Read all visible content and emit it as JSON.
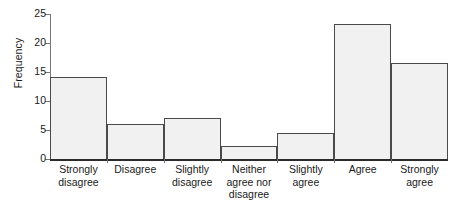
{
  "chart_data": {
    "type": "bar",
    "title": "",
    "xlabel": "",
    "ylabel": "Frequency",
    "categories": [
      "Strongly disagree",
      "Disagree",
      "Slightly disagree",
      "Neither agree nor disagree",
      "Slightly agree",
      "Agree",
      "Strongly agree"
    ],
    "category_lines": [
      [
        "Strongly",
        "disagree"
      ],
      [
        "Disagree"
      ],
      [
        "Slightly",
        "disagree"
      ],
      [
        "Neither",
        "agree nor",
        "disagree"
      ],
      [
        "Slightly",
        "agree"
      ],
      [
        "Agree"
      ],
      [
        "Strongly",
        "agree"
      ]
    ],
    "values": [
      14.1,
      6.0,
      7.1,
      2.2,
      4.4,
      23.3,
      16.5
    ],
    "ylim": [
      0,
      25
    ],
    "yticks": [
      0,
      5,
      10,
      15,
      20,
      25
    ],
    "ytick_labels": [
      "0",
      "5",
      "10",
      "15",
      "20",
      "25"
    ],
    "grid": false,
    "legend": null,
    "bar_fill": "#f1f1f1",
    "bar_edge": "#4a4a4a",
    "axis_color": "#2b2b2b",
    "background": "#ffffff"
  }
}
